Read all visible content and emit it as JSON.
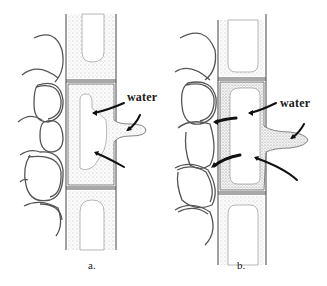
{
  "figure": {
    "type": "biological-illustration",
    "colors": {
      "line": "#4a4a4a",
      "stipple": "#9a9a9a",
      "arrow": "#111111",
      "background": "#ffffff"
    }
  },
  "panels": [
    {
      "id": "a",
      "label": "a.",
      "annotation": "water",
      "arrows": 3
    },
    {
      "id": "b",
      "label": "b.",
      "annotation": "water",
      "arrows": 5
    }
  ]
}
